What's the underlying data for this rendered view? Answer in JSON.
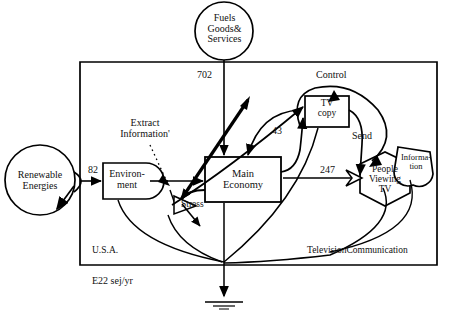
{
  "diagram": {
    "units_note": "E22 sej/yr",
    "boundary_label_left": "U.S.A.",
    "boundary_label_right": "TelevisionCommunication",
    "ink_color": "#000000",
    "background_color": "#ffffff"
  },
  "sources": [
    {
      "id": "renewable",
      "name": "Renewable Energies",
      "shape": "circle",
      "text_lines": [
        "Renewable",
        "Energies"
      ]
    },
    {
      "id": "fuels",
      "name": "Fuels Goods& Services",
      "shape": "circle",
      "text_lines": [
        "Fuels",
        "Goods&",
        "Services"
      ]
    }
  ],
  "storages": [
    {
      "id": "environment",
      "name": "Environment",
      "shape": "tank",
      "text_lines": [
        "Environ-",
        "ment"
      ]
    },
    {
      "id": "main-economy",
      "name": "Main Economy",
      "shape": "box",
      "text_lines": [
        "Main",
        "Economy"
      ]
    },
    {
      "id": "tv-copy",
      "name": "TV copy",
      "shape": "box",
      "text_lines": [
        "TV",
        "copy"
      ]
    },
    {
      "id": "people-viewing-tv",
      "name": "People Viewing TV",
      "shape": "hexagon",
      "text_lines": [
        "People",
        "Viewing",
        "TV"
      ]
    },
    {
      "id": "information",
      "name": "Information",
      "shape": "shield",
      "text_lines": [
        "Informa-",
        "tion"
      ]
    }
  ],
  "flow_values": [
    {
      "id": "flow-82",
      "value": "82",
      "from": "renewable",
      "to": "environment"
    },
    {
      "id": "flow-702",
      "value": "702",
      "from": "fuels",
      "to": "main-economy"
    },
    {
      "id": "flow-43",
      "value": "43",
      "from": "main-economy",
      "to": "tv-copy"
    },
    {
      "id": "flow-247",
      "value": "247",
      "from": "main-economy",
      "to": "people-viewing-tv"
    }
  ],
  "process_labels": [
    {
      "id": "extract-information",
      "text_lines": [
        "Extract",
        "Information'"
      ]
    },
    {
      "id": "stress",
      "text_lines": [
        "Stress"
      ]
    },
    {
      "id": "control",
      "text_lines": [
        "Control"
      ]
    },
    {
      "id": "send",
      "text_lines": [
        "Send"
      ]
    }
  ],
  "heat_sinks": [
    {
      "id": "heat-sink-bottom",
      "description": "ground symbol at diagram bottom"
    }
  ],
  "text": {
    "renewable_l1": "Renewable",
    "renewable_l2": "Energies",
    "fuels_l1": "Fuels",
    "fuels_l2": "Goods&",
    "fuels_l3": "Services",
    "environment_l1": "Environ-",
    "environment_l2": "ment",
    "main_economy_l1": "Main",
    "main_economy_l2": "Economy",
    "tvcopy_l1": "TV",
    "tvcopy_l2": "copy",
    "people_l1": "People",
    "people_l2": "Viewing",
    "people_l3": "TV",
    "information_l1": "Informa-",
    "information_l2": "tion",
    "extract_l1": "Extract",
    "extract_l2": "Information'",
    "stress": "Stress",
    "control": "Control",
    "send": "Send",
    "v82": "82",
    "v702": "702",
    "v43": "43",
    "v247": "247",
    "usa": "U.S.A.",
    "television": "TelevisionCommunication",
    "units": "E22 sej/yr"
  }
}
